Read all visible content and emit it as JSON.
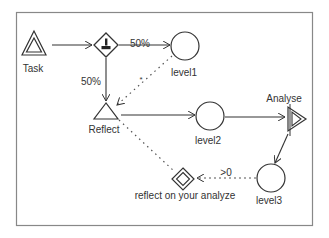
{
  "diagram": {
    "nodes": {
      "task": {
        "label": "Task",
        "shape": "double-triangle"
      },
      "gateway": {
        "label": "",
        "shape": "diamond-with-person-icon"
      },
      "level1": {
        "label": "level1",
        "shape": "circle"
      },
      "reflect": {
        "label": "Reflect",
        "shape": "triangle"
      },
      "level2": {
        "label": "level2",
        "shape": "circle"
      },
      "analyse": {
        "label": "Analyse",
        "shape": "double-triangle-right"
      },
      "level3": {
        "label": "level3",
        "shape": "circle"
      },
      "reflect_gateway": {
        "label": "reflect on your analyze",
        "shape": "double-diamond"
      }
    },
    "edges": [
      {
        "from": "task",
        "to": "gateway",
        "style": "solid",
        "label": ""
      },
      {
        "from": "gateway",
        "to": "level1",
        "style": "solid",
        "label": "50%"
      },
      {
        "from": "gateway",
        "to": "reflect",
        "style": "solid",
        "label": "50%"
      },
      {
        "from": "level1",
        "to": "reflect",
        "style": "dotted",
        "label": "*"
      },
      {
        "from": "reflect",
        "to": "level2",
        "style": "solid",
        "label": ""
      },
      {
        "from": "level2",
        "to": "analyse",
        "style": "solid",
        "label": ""
      },
      {
        "from": "analyse",
        "to": "level3",
        "style": "solid",
        "label": ""
      },
      {
        "from": "level3",
        "to": "reflect_gateway",
        "style": "dotted",
        "label": ">0"
      },
      {
        "from": "reflect_gateway",
        "to": "reflect",
        "style": "dotted",
        "label": ""
      }
    ],
    "colors": {
      "stroke": "#333333",
      "frame": "#888888",
      "background": "#ffffff"
    }
  }
}
